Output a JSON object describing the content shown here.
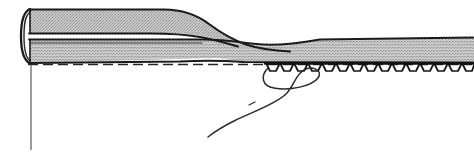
{
  "figure": {
    "type": "technical-line-drawing",
    "width": 474,
    "height": 155,
    "background_color": "#ffffff"
  },
  "colors": {
    "background": "#ffffff",
    "ink": "#1a1a1a",
    "fabric_fill": "#b8b8b8",
    "fabric_fill_light": "#c4c4c4",
    "thread": "#2b2b2b",
    "dash_line": "#262626"
  },
  "elements": {
    "folded_edge": {
      "name": "folded-hem-edge",
      "description": "Rounded fold at left end of fabric",
      "x": 22,
      "y_top": 8,
      "y_bottom": 63
    },
    "upper_ply": {
      "name": "upper-fabric-ply",
      "description": "Upper folded-back fabric layer tapering to a point",
      "x_start": 26,
      "x_taper_end": 212,
      "y_top": 9,
      "y_bottom": 34
    },
    "lower_ply": {
      "name": "lower-fabric-ply",
      "description": "Main fabric body layer running full width",
      "x_start": 26,
      "x_end": 474,
      "y_top": 38,
      "y_bottom": 63
    },
    "tapered_tongue": {
      "name": "fabric-fold-tongue",
      "description": "Secondary tapered fold tongue crossing to the right",
      "x_start": 205,
      "x_end": 292,
      "y": 48
    },
    "dashed_line": {
      "name": "dashed-guide-line",
      "description": "Horizontal dashed stitching guideline",
      "y": 64,
      "x_start": 28,
      "x_end": 472,
      "dash_length": 10,
      "gap_length": 5
    },
    "vertical_guide": {
      "name": "vertical-guide-line",
      "description": "Thin vertical reference line below fold",
      "x": 31,
      "y_start": 64,
      "y_end": 150
    },
    "overlock_stitches": {
      "name": "overlock-stitch-row",
      "description": "Zigzag overlock serger stitches along fabric lower edge",
      "x_start": 266,
      "x_end": 472,
      "y_top": 63,
      "y_bottom": 72,
      "count": 15,
      "pitch": 14
    },
    "thread_tail": {
      "name": "loose-thread-tail",
      "description": "Loose serger thread chain looping down and to the left",
      "loop_x": 300,
      "loop_y": 78,
      "tail_end_x": 208,
      "tail_end_y": 137
    }
  },
  "labels": {
    "figure_caption": "",
    "alt_text": "Cross-section line drawing of a folded fabric hem with overlock stitching and a trailing thread"
  }
}
